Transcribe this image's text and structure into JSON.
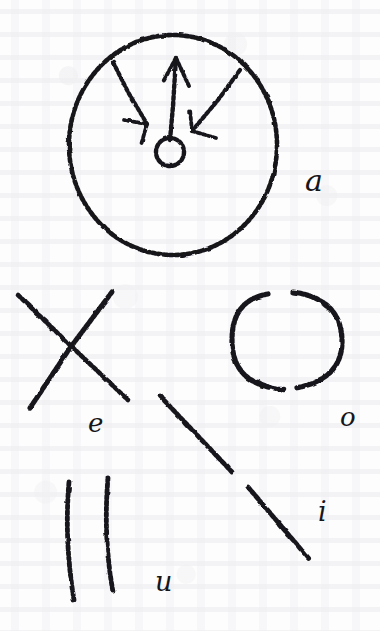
{
  "document": {
    "kind": "handwritten-sketch",
    "medium": "ink on paper",
    "ink_color": "#16161a",
    "paper_color": "#fdfdfd",
    "width": 380,
    "height": 631
  },
  "figures": [
    {
      "id": "figure-a",
      "label": "a",
      "shape": "large open circle with three arrows radiating outward from a small central ring",
      "label_x": 305,
      "label_y": 166,
      "label_size": 30,
      "circle": {
        "cx": 173,
        "cy": 145,
        "rx": 104,
        "ry": 110
      },
      "hub": {
        "cx": 170,
        "cy": 152,
        "r": 14
      },
      "arrows": [
        {
          "id": "arrow-up",
          "direction": "up",
          "from_x": 170,
          "from_y": 142,
          "to_x": 176,
          "to_y": 58
        },
        {
          "id": "arrow-upper-left",
          "direction": "upper-left",
          "from_x": 146,
          "from_y": 122,
          "to_x": 113,
          "to_y": 62
        },
        {
          "id": "arrow-upper-right",
          "direction": "upper-right",
          "from_x": 193,
          "from_y": 132,
          "to_x": 240,
          "to_y": 70
        }
      ]
    },
    {
      "id": "figure-e",
      "label": "e",
      "shape": "two crossed diagonal strokes forming an X",
      "label_x": 88,
      "label_y": 410,
      "label_size": 26,
      "strokes": [
        {
          "id": "stroke-down-right",
          "x1": 18,
          "y1": 295,
          "x2": 128,
          "y2": 400
        },
        {
          "id": "stroke-up-right",
          "x1": 30,
          "y1": 408,
          "x2": 112,
          "y2": 292
        }
      ]
    },
    {
      "id": "figure-o",
      "label": "o",
      "shape": "open oval ring with gaps at the top and the bottom",
      "label_x": 340,
      "label_y": 404,
      "label_size": 26,
      "ring": {
        "cx": 287,
        "cy": 340,
        "rx": 55,
        "ry": 48
      }
    },
    {
      "id": "figure-i",
      "label": "i",
      "shape": "long diagonal stroke descending to the right, broken near its middle",
      "label_x": 318,
      "label_y": 518,
      "label_size": 27,
      "strokes": [
        {
          "id": "stroke-upper",
          "x1": 160,
          "y1": 396,
          "x2": 232,
          "y2": 472
        },
        {
          "id": "stroke-lower",
          "x1": 248,
          "y1": 487,
          "x2": 310,
          "y2": 560
        }
      ]
    },
    {
      "id": "figure-u",
      "label": "u",
      "shape": "two near-vertical parallel strokes, slightly bowed",
      "label_x": 155,
      "label_y": 588,
      "label_size": 27,
      "strokes": [
        {
          "id": "stroke-left",
          "x1": 69,
          "y1": 482,
          "x2": 74,
          "y2": 600
        },
        {
          "id": "stroke-right",
          "x1": 108,
          "y1": 478,
          "x2": 113,
          "y2": 592
        }
      ]
    }
  ]
}
